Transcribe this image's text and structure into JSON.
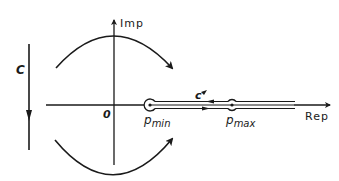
{
  "diagram": {
    "type": "complex-plane-contour",
    "axes": {
      "imaginary_label": "Imp",
      "real_label": "Rep",
      "origin_label": "0"
    },
    "contours": {
      "outer_contour_label": "C",
      "inner_contour_label": "c"
    },
    "points": [
      {
        "id": "pmin",
        "base": "p",
        "subscript": "min"
      },
      {
        "id": "pmax",
        "base": "p",
        "subscript": "max"
      }
    ],
    "colors": {
      "ink": "#1a1a1a",
      "background": "#ffffff"
    }
  }
}
